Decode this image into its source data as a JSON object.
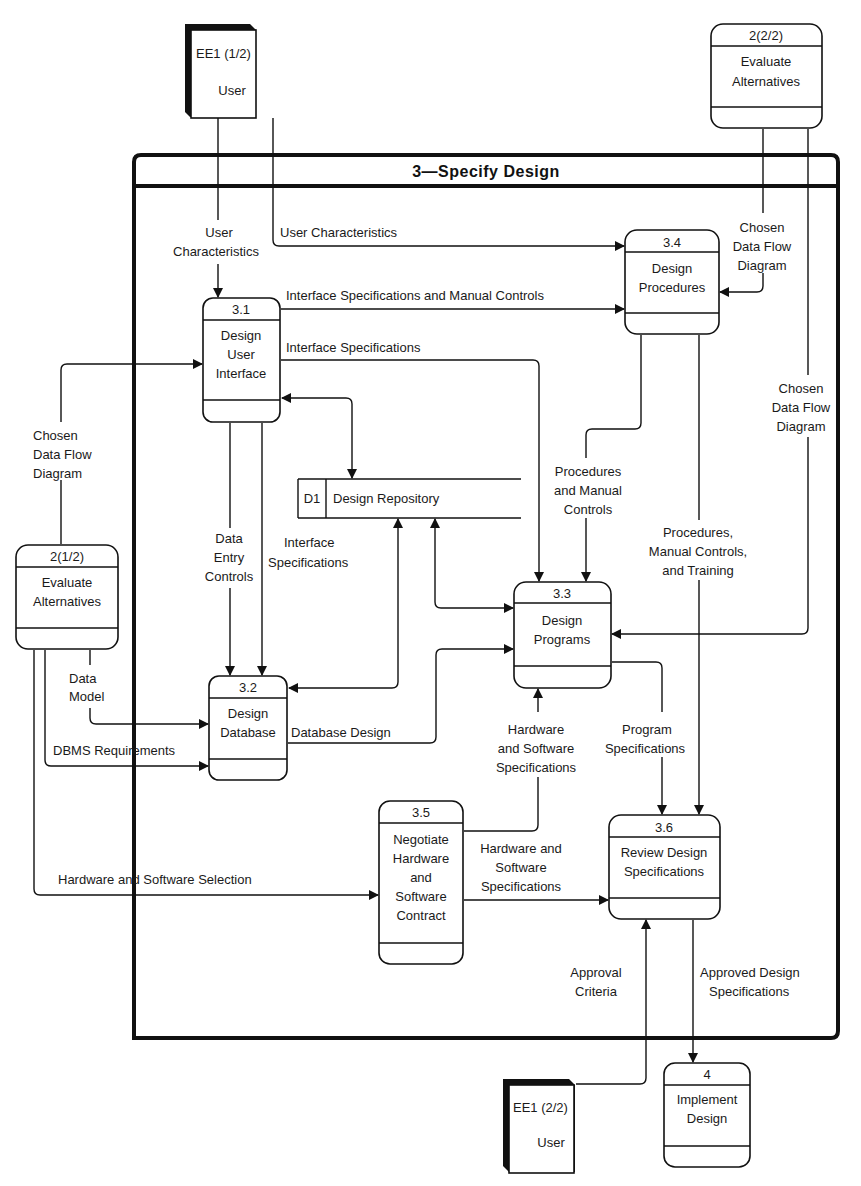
{
  "diagram": {
    "title": "3—Specify Design",
    "external_entities": [
      {
        "id": "EE1 (1/2)",
        "name": "User"
      },
      {
        "id": "EE1 (2/2)",
        "name": "User"
      }
    ],
    "processes": {
      "p2a": {
        "id": "2(1/2)",
        "line1": "Evaluate",
        "line2": "Alternatives"
      },
      "p2b": {
        "id": "2(2/2)",
        "line1": "Evaluate",
        "line2": "Alternatives"
      },
      "p31": {
        "id": "3.1",
        "line1": "Design",
        "line2": "User",
        "line3": "Interface"
      },
      "p32": {
        "id": "3.2",
        "line1": "Design",
        "line2": "Database"
      },
      "p33": {
        "id": "3.3",
        "line1": "Design",
        "line2": "Programs"
      },
      "p34": {
        "id": "3.4",
        "line1": "Design",
        "line2": "Procedures"
      },
      "p35": {
        "id": "3.5",
        "line1": "Negotiate",
        "line2": "Hardware",
        "line3": "and",
        "line4": "Software",
        "line5": "Contract"
      },
      "p36": {
        "id": "3.6",
        "line1": "Review Design",
        "line2": "Specifications"
      },
      "p4": {
        "id": "4",
        "line1": "Implement",
        "line2": "Design"
      }
    },
    "data_store": {
      "id": "D1",
      "name": "Design Repository"
    },
    "flows": {
      "user_char_left": {
        "l1": "User",
        "l2": "Characteristics"
      },
      "user_char_right": "User Characteristics",
      "iface_spec_manual": "Interface Specifications and Manual Controls",
      "iface_spec": "Interface Specifications",
      "chosen_dfd_left": {
        "l1": "Chosen",
        "l2": "Data Flow",
        "l3": "Diagram"
      },
      "chosen_dfd_top": {
        "l1": "Chosen",
        "l2": "Data Flow",
        "l3": "Diagram"
      },
      "chosen_dfd_right": {
        "l1": "Chosen",
        "l2": "Data Flow",
        "l3": "Diagram"
      },
      "data_entry": {
        "l1": "Data",
        "l2": "Entry",
        "l3": "Controls"
      },
      "iface_spec_db": {
        "l1": "Interface",
        "l2": "Specifications"
      },
      "proc_manual": {
        "l1": "Procedures",
        "l2": "and Manual",
        "l3": "Controls"
      },
      "proc_manual_training": {
        "l1": "Procedures,",
        "l2": "Manual Controls,",
        "l3": "and Training"
      },
      "data_model": {
        "l1": "Data",
        "l2": "Model"
      },
      "dbms_req": "DBMS Requirements",
      "db_design": "Database Design",
      "hw_sw_spec_up": {
        "l1": "Hardware",
        "l2": "and Software",
        "l3": "Specifications"
      },
      "program_spec": {
        "l1": "Program",
        "l2": "Specifications"
      },
      "hw_sw_selection": "Hardware and Software Selection",
      "hw_sw_spec_right": {
        "l1": "Hardware and",
        "l2": "Software",
        "l3": "Specifications"
      },
      "approval_criteria": {
        "l1": "Approval",
        "l2": "Criteria"
      },
      "approved_design": {
        "l1": "Approved Design",
        "l2": "Specifications"
      }
    }
  }
}
